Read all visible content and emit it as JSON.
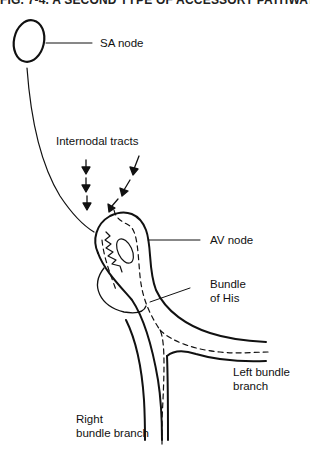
{
  "figure": {
    "title": "FIG. 7-4. A SECOND TYPE OF ACCESSORY PATHWAY"
  },
  "labels": {
    "sa_node": "SA node",
    "internodal_tracts": "Internodal tracts",
    "av_node": "AV node",
    "bundle_of_his_line1": "Bundle",
    "bundle_of_his_line2": "of His",
    "left_bundle_line1": "Left bundle",
    "left_bundle_line2": "branch",
    "right_bundle_line1": "Right",
    "right_bundle_line2": "bundle branch"
  },
  "colors": {
    "stroke": "#111111",
    "background": "#ffffff"
  }
}
